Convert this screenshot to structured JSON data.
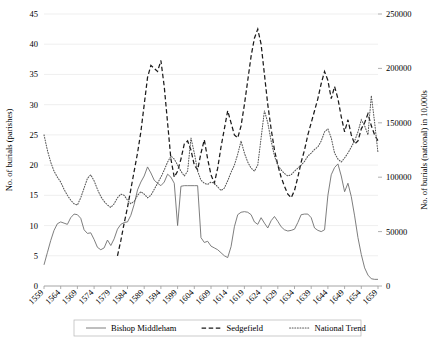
{
  "chart_data": {
    "type": "line",
    "title": "",
    "xlabel": "",
    "ylabel": "No. of burials (parishes)",
    "y2label": "No. of burials (national) in 10,000s",
    "xlim": [
      1559,
      1659
    ],
    "ylim": [
      0,
      45
    ],
    "y2lim": [
      0,
      250000
    ],
    "grid": true,
    "legend_position": "bottom",
    "xticks": [
      "1559",
      "1564",
      "1569",
      "1574",
      "1579",
      "1584",
      "1589",
      "1594",
      "1599",
      "1604",
      "1609",
      "1614",
      "1619",
      "1624",
      "1629",
      "1634",
      "1639",
      "1644",
      "1649",
      "1654",
      "1659"
    ],
    "yticks": [
      "0",
      "5",
      "10",
      "15",
      "20",
      "25",
      "30",
      "35",
      "40",
      "45"
    ],
    "y2ticks": [
      "0",
      "50000",
      "100000",
      "150000",
      "200000",
      "250000"
    ],
    "x": [
      1559,
      1560,
      1561,
      1562,
      1563,
      1564,
      1565,
      1566,
      1567,
      1568,
      1569,
      1570,
      1571,
      1572,
      1573,
      1574,
      1575,
      1576,
      1577,
      1578,
      1579,
      1580,
      1581,
      1582,
      1583,
      1584,
      1585,
      1586,
      1587,
      1588,
      1589,
      1590,
      1591,
      1592,
      1593,
      1594,
      1595,
      1596,
      1597,
      1598,
      1599,
      1600,
      1601,
      1602,
      1603,
      1604,
      1605,
      1606,
      1607,
      1608,
      1609,
      1610,
      1611,
      1612,
      1613,
      1614,
      1615,
      1616,
      1617,
      1618,
      1619,
      1620,
      1621,
      1622,
      1623,
      1624,
      1625,
      1626,
      1627,
      1628,
      1629,
      1630,
      1631,
      1632,
      1633,
      1634,
      1635,
      1636,
      1637,
      1638,
      1639,
      1640,
      1641,
      1642,
      1643,
      1644,
      1645,
      1646,
      1647,
      1648,
      1649,
      1650,
      1651,
      1652,
      1653,
      1654,
      1655,
      1656,
      1657,
      1658,
      1659
    ],
    "series": [
      {
        "name": "Bishop Middleham",
        "style": "solid",
        "color": "#6f6f6f",
        "values": [
          3.5,
          5.5,
          7.5,
          9.2,
          10.3,
          10.6,
          10.4,
          10.2,
          11.3,
          11.9,
          11.8,
          11.2,
          9.3,
          8.7,
          8.8,
          7.7,
          6.4,
          6.0,
          6.3,
          7.6,
          6.7,
          7.8,
          9.4,
          10.2,
          10.5,
          10.6,
          11.7,
          13.5,
          15.9,
          17.2,
          18.2,
          19.7,
          18.7,
          17.5,
          17.0,
          16.6,
          17.2,
          18.5,
          18.0,
          17.0,
          10.0,
          16.5,
          16.6,
          16.6,
          16.6,
          16.6,
          16.6,
          8.0,
          7.2,
          7.4,
          6.6,
          6.3,
          6.0,
          5.5,
          5.0,
          4.7,
          6.5,
          9.8,
          11.8,
          12.2,
          12.3,
          12.2,
          11.8,
          10.6,
          10.2,
          11.3,
          10.4,
          9.6,
          10.8,
          11.5,
          10.7,
          9.8,
          9.3,
          9.1,
          9.2,
          9.4,
          10.5,
          11.8,
          11.9,
          11.9,
          11.3,
          9.6,
          9.2,
          9.0,
          9.3,
          15.0,
          18.4,
          19.6,
          20.2,
          18.2,
          15.6,
          17.0,
          14.8,
          11.6,
          8.0,
          5.2,
          3.0,
          1.8,
          1.2,
          1.1,
          1.1
        ]
      },
      {
        "name": "Sedgefield",
        "style": "dashed",
        "color": "#1a1a1a",
        "values": [
          null,
          null,
          null,
          null,
          null,
          null,
          null,
          null,
          null,
          null,
          null,
          null,
          null,
          null,
          null,
          null,
          null,
          null,
          null,
          null,
          null,
          null,
          5.0,
          7.5,
          10.4,
          13.0,
          16.0,
          19.0,
          22.0,
          25.5,
          30.0,
          34.5,
          36.5,
          36.0,
          35.5,
          37.3,
          33.0,
          27.0,
          21.0,
          18.0,
          19.0,
          21.0,
          23.5,
          24.0,
          22.5,
          20.0,
          19.2,
          22.0,
          24.2,
          21.0,
          18.4,
          17.0,
          19.5,
          23.0,
          26.0,
          29.0,
          27.0,
          25.0,
          24.5,
          26.5,
          30.0,
          34.0,
          38.0,
          41.0,
          42.5,
          40.0,
          35.0,
          30.0,
          26.0,
          22.5,
          20.0,
          18.0,
          16.5,
          15.2,
          14.6,
          15.8,
          18.0,
          20.5,
          22.5,
          25.0,
          27.0,
          29.0,
          31.0,
          33.5,
          35.5,
          34.0,
          31.0,
          33.0,
          31.0,
          28.0,
          25.5,
          27.5,
          25.0,
          23.5,
          24.0,
          26.0,
          27.0,
          28.5,
          26.5,
          25.0,
          24.0
        ]
      },
      {
        "name": "National Trend",
        "style": "dotted",
        "color": "#555555",
        "values": [
          25.0,
          22.5,
          20.5,
          19.0,
          18.0,
          17.2,
          16.0,
          15.0,
          14.2,
          13.6,
          13.4,
          14.6,
          16.2,
          17.8,
          18.4,
          17.4,
          16.0,
          14.8,
          14.0,
          13.4,
          13.0,
          13.6,
          14.6,
          15.2,
          15.0,
          14.2,
          13.6,
          14.0,
          15.0,
          15.6,
          15.2,
          14.6,
          15.0,
          16.0,
          17.0,
          18.0,
          19.2,
          20.5,
          21.5,
          21.0,
          20.0,
          19.0,
          18.2,
          19.0,
          24.5,
          22.0,
          19.0,
          17.5,
          17.0,
          16.8,
          17.2,
          17.0,
          16.4,
          15.8,
          16.2,
          17.4,
          18.8,
          20.0,
          21.8,
          24.0,
          22.0,
          20.5,
          19.5,
          19.0,
          20.0,
          24.5,
          29.0,
          27.0,
          24.0,
          21.5,
          20.0,
          19.2,
          18.6,
          18.2,
          18.4,
          19.0,
          19.5,
          20.0,
          20.6,
          21.5,
          22.0,
          22.6,
          23.0,
          24.0,
          25.5,
          26.0,
          24.5,
          22.0,
          21.0,
          20.5,
          21.2,
          22.0,
          23.0,
          24.0,
          25.5,
          27.5,
          26.5,
          25.0,
          31.5,
          27.0,
          22.0
        ]
      }
    ]
  },
  "legend": {
    "items": [
      {
        "label": "Bishop Middleham",
        "style": "solid"
      },
      {
        "label": "Sedgefield",
        "style": "dashed"
      },
      {
        "label": "National Trend",
        "style": "dotted"
      }
    ]
  }
}
